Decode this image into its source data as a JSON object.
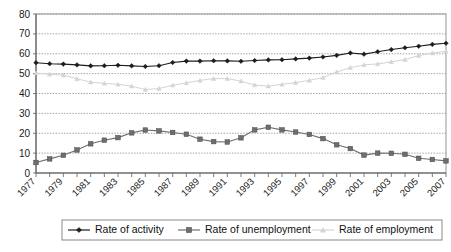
{
  "chart_data": {
    "type": "line",
    "title": "",
    "subtitle": "",
    "xlabel": "",
    "ylabel": "",
    "ylim": [
      0,
      80
    ],
    "ytick_step": 10,
    "yticks": [
      0,
      10,
      20,
      30,
      40,
      50,
      60,
      70,
      80
    ],
    "grid": true,
    "legend_position": "bottom",
    "x": [
      1977,
      1978,
      1979,
      1980,
      1981,
      1982,
      1983,
      1984,
      1985,
      1986,
      1987,
      1988,
      1989,
      1990,
      1991,
      1992,
      1993,
      1994,
      1995,
      1996,
      1997,
      1998,
      1999,
      2000,
      2001,
      2002,
      2003,
      2004,
      2005,
      2006,
      2007
    ],
    "xtick_labels": [
      "1977",
      "1979",
      "1981",
      "1983",
      "1985",
      "1987",
      "1989",
      "1991",
      "1993",
      "1995",
      "1997",
      "1999",
      "2001",
      "2003",
      "2005",
      "2007"
    ],
    "series": [
      {
        "name": "Rate of activity",
        "color": "#1c1c1c",
        "marker": "diamond",
        "values": [
          55.5,
          55.0,
          54.8,
          54.4,
          53.9,
          54.0,
          54.2,
          53.9,
          53.6,
          54.0,
          55.6,
          56.3,
          56.3,
          56.5,
          56.4,
          56.2,
          56.6,
          56.9,
          57.0,
          57.4,
          57.8,
          58.4,
          59.2,
          60.4,
          59.8,
          61.0,
          62.1,
          63.0,
          63.8,
          64.7,
          65.3
        ]
      },
      {
        "name": "Rate of unemployment",
        "color": "#6e6e6e",
        "marker": "square",
        "values": [
          5.3,
          7.1,
          8.9,
          11.6,
          14.7,
          16.5,
          17.8,
          20.2,
          21.6,
          21.2,
          20.4,
          19.5,
          17.0,
          15.8,
          15.6,
          17.7,
          21.7,
          23.0,
          21.7,
          20.6,
          19.4,
          17.3,
          14.2,
          12.3,
          9.0,
          10.0,
          9.9,
          9.4,
          7.4,
          6.8,
          6.1
        ]
      },
      {
        "name": "Rate of employment",
        "color": "#d4d4d4",
        "marker": "triangle",
        "values": [
          50.3,
          49.7,
          49.3,
          47.4,
          45.7,
          45.1,
          44.6,
          43.7,
          42.0,
          42.5,
          44.2,
          45.3,
          46.6,
          47.5,
          47.5,
          46.2,
          44.3,
          43.7,
          44.6,
          45.5,
          46.6,
          48.0,
          50.8,
          53.0,
          54.4,
          54.9,
          55.9,
          57.1,
          59.1,
          60.3,
          61.3
        ]
      }
    ]
  },
  "legend": {
    "items": [
      {
        "label": "Rate of activity",
        "marker": "diamond",
        "color": "#1c1c1c"
      },
      {
        "label": "Rate of unemployment",
        "marker": "square",
        "color": "#6e6e6e"
      },
      {
        "label": "Rate of employment",
        "marker": "triangle",
        "color": "#d4d4d4"
      }
    ]
  },
  "axes": {
    "y_labels": [
      "80",
      "70",
      "60",
      "50",
      "40",
      "30",
      "20",
      "10",
      "0"
    ],
    "x_labels": [
      "1977",
      "1979",
      "1981",
      "1983",
      "1985",
      "1987",
      "1989",
      "1991",
      "1993",
      "1995",
      "1997",
      "1999",
      "2001",
      "2003",
      "2005",
      "2007"
    ]
  }
}
